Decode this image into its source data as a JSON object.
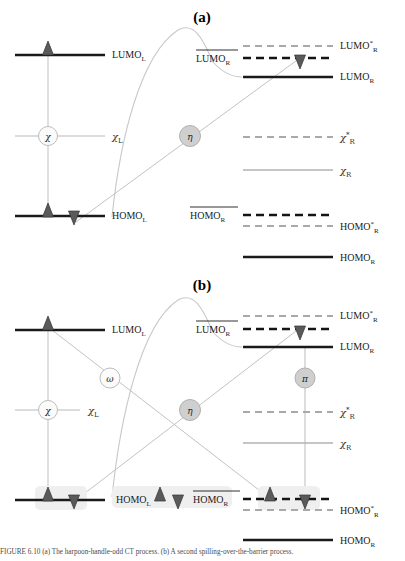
{
  "figure": {
    "panels": [
      {
        "id": "a",
        "label": "(a)",
        "left_levels": [
          {
            "name": "LUMO_L",
            "label": "LUMO",
            "sub": "L",
            "sup": "",
            "style": "solid-black"
          },
          {
            "name": "chi_L",
            "label": "χ",
            "sub": "L",
            "sup": "",
            "style": "solid-gray"
          },
          {
            "name": "HOMO_L",
            "label": "HOMO",
            "sub": "L",
            "sup": "",
            "style": "solid-black"
          }
        ],
        "right_levels": [
          {
            "name": "LUMO_R_star",
            "label": "LUMO",
            "sub": "R",
            "sup": "*",
            "style": "dashed-gray"
          },
          {
            "name": "LUMO_R_overline",
            "label": "LUMO",
            "sub": "R",
            "sup": "",
            "style": "dashed-black",
            "overline": true,
            "label_side": "left"
          },
          {
            "name": "LUMO_R",
            "label": "LUMO",
            "sub": "R",
            "sup": "",
            "style": "solid-black"
          },
          {
            "name": "chi_R_star",
            "label": "χ",
            "sub": "R",
            "sup": "*",
            "style": "dashed-gray"
          },
          {
            "name": "chi_R",
            "label": "χ",
            "sub": "R",
            "sup": "",
            "style": "solid-gray"
          },
          {
            "name": "HOMO_R_overline",
            "label": "HOMO",
            "sub": "R",
            "sup": "",
            "style": "dashed-black",
            "overline": true,
            "label_side": "left"
          },
          {
            "name": "HOMO_R_star",
            "label": "HOMO",
            "sub": "R",
            "sup": "*",
            "style": "dashed-gray"
          },
          {
            "name": "HOMO_R",
            "label": "HOMO",
            "sub": "R",
            "sup": "",
            "style": "solid-black"
          }
        ],
        "nodes": [
          {
            "name": "chi-node",
            "symbol": "χ",
            "fill": "white"
          },
          {
            "name": "eta-node",
            "symbol": "η",
            "fill": "gray"
          }
        ],
        "electrons": [
          {
            "name": "lumo-l-up",
            "spin": "up",
            "on": "LUMO_L"
          },
          {
            "name": "homo-l-up",
            "spin": "up",
            "on": "HOMO_L"
          },
          {
            "name": "homo-l-down",
            "spin": "down",
            "on": "HOMO_L"
          },
          {
            "name": "lumo-r-down",
            "spin": "down",
            "on": "LUMO_R_overline"
          }
        ]
      },
      {
        "id": "b",
        "label": "(b)",
        "left_levels": [
          {
            "name": "LUMO_L",
            "label": "LUMO",
            "sub": "L",
            "sup": "",
            "style": "solid-black"
          },
          {
            "name": "chi_L",
            "label": "χ",
            "sub": "L",
            "sup": "",
            "style": "solid-gray"
          },
          {
            "name": "HOMO_L",
            "label": "HOMO",
            "sub": "L",
            "sup": "",
            "style": "solid-black"
          }
        ],
        "right_levels": [
          {
            "name": "LUMO_R_star",
            "label": "LUMO",
            "sub": "R",
            "sup": "*",
            "style": "dashed-gray"
          },
          {
            "name": "LUMO_R_overline",
            "label": "LUMO",
            "sub": "R",
            "sup": "",
            "style": "dashed-black",
            "overline": true,
            "label_side": "left"
          },
          {
            "name": "LUMO_R",
            "label": "LUMO",
            "sub": "R",
            "sup": "",
            "style": "solid-black"
          },
          {
            "name": "chi_R_star",
            "label": "χ",
            "sub": "R",
            "sup": "*",
            "style": "dashed-gray"
          },
          {
            "name": "chi_R",
            "label": "χ",
            "sub": "R",
            "sup": "",
            "style": "solid-gray"
          },
          {
            "name": "HOMO_R_overline",
            "label": "HOMO",
            "sub": "R",
            "sup": "",
            "style": "dashed-black",
            "overline": true,
            "label_side": "left"
          },
          {
            "name": "HOMO_R_star",
            "label": "HOMO",
            "sub": "R",
            "sup": "*",
            "style": "dashed-gray"
          },
          {
            "name": "HOMO_R",
            "label": "HOMO",
            "sub": "R",
            "sup": "",
            "style": "solid-black"
          }
        ],
        "nodes": [
          {
            "name": "chi-node",
            "symbol": "χ",
            "fill": "white"
          },
          {
            "name": "omega-node",
            "symbol": "ω",
            "fill": "white"
          },
          {
            "name": "eta-node",
            "symbol": "η",
            "fill": "gray"
          },
          {
            "name": "pi-node",
            "symbol": "π",
            "fill": "gray"
          }
        ],
        "electrons": [
          {
            "name": "lumo-l-up",
            "spin": "up",
            "on": "LUMO_L"
          },
          {
            "name": "homo-l-up",
            "spin": "up",
            "on": "HOMO_L"
          },
          {
            "name": "homo-l-down",
            "spin": "down",
            "on": "HOMO_L"
          },
          {
            "name": "lumo-r-down",
            "spin": "down",
            "on": "LUMO_R_overline"
          },
          {
            "name": "homo-r-up",
            "spin": "up",
            "on": "HOMO_R_overline"
          },
          {
            "name": "homo-r-down",
            "spin": "down",
            "on": "HOMO_R_overline"
          },
          {
            "name": "inline-legend-up",
            "spin": "up",
            "on": "inline"
          },
          {
            "name": "inline-legend-down",
            "spin": "down",
            "on": "inline"
          }
        ]
      }
    ],
    "symbols": {
      "chi": "χ",
      "eta": "η",
      "omega": "ω",
      "pi": "π",
      "star": "*",
      "lumo": "LUMO",
      "homo": "HOMO",
      "sub_L": "L",
      "sub_R": "R"
    },
    "colors": {
      "black_level": "#1a1a1a",
      "gray_level": "#9a9a9a",
      "connector": "#c3c3c3",
      "arrow_fill": "#5a5a5a",
      "node_gray_fill": "#cfcfcf",
      "node_white_fill": "#fbfbfb",
      "node_stroke": "#b0b0b0",
      "highlight": "#efefef",
      "text": "#1a1a1a"
    },
    "caption": "FIGURE 6.10  (a) The harpoon-handle-odd CT process. (b) A second spilling-over-the-barrier process."
  }
}
